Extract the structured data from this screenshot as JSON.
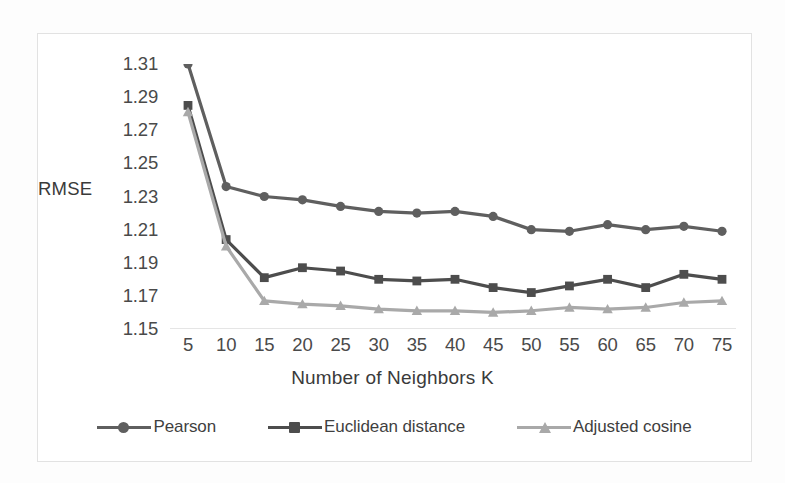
{
  "chart_data": {
    "type": "line",
    "title": "",
    "subtitle": "",
    "xlabel": "Number of Neighbors K",
    "ylabel": "RMSE",
    "x": [
      5,
      10,
      15,
      20,
      25,
      30,
      35,
      40,
      45,
      50,
      55,
      60,
      65,
      70,
      75
    ],
    "xticklabels": [
      "5",
      "10",
      "15",
      "20",
      "25",
      "30",
      "35",
      "40",
      "45",
      "50",
      "55",
      "60",
      "65",
      "70",
      "75"
    ],
    "yticklabels": [
      "1.31",
      "1.29",
      "1.27",
      "1.25",
      "1.23",
      "1.21",
      "1.19",
      "1.17",
      "1.15"
    ],
    "yticks": [
      1.31,
      1.29,
      1.27,
      1.25,
      1.23,
      1.21,
      1.19,
      1.17,
      1.15
    ],
    "ylim": [
      1.15,
      1.31
    ],
    "xlim": [
      5,
      75
    ],
    "grid": false,
    "legend_position": "bottom",
    "series": [
      {
        "name": "Pearson",
        "marker": "circle",
        "color": "#5f5f5f",
        "values": [
          1.31,
          1.236,
          1.23,
          1.228,
          1.224,
          1.221,
          1.22,
          1.221,
          1.218,
          1.21,
          1.209,
          1.213,
          1.21,
          1.212,
          1.209
        ]
      },
      {
        "name": "Euclidean distance",
        "marker": "square",
        "color": "#4d4d4d",
        "values": [
          1.285,
          1.204,
          1.181,
          1.187,
          1.185,
          1.18,
          1.179,
          1.18,
          1.175,
          1.172,
          1.176,
          1.18,
          1.175,
          1.183,
          1.18
        ]
      },
      {
        "name": "Adjusted cosine",
        "marker": "triangle",
        "color": "#a9a9a9",
        "values": [
          1.281,
          1.2,
          1.167,
          1.165,
          1.164,
          1.162,
          1.161,
          1.161,
          1.16,
          1.161,
          1.163,
          1.162,
          1.163,
          1.166,
          1.167
        ]
      }
    ]
  },
  "axis": {
    "y_title": "RMSE",
    "x_title": "Number of Neighbors K"
  },
  "legend": {
    "items": [
      {
        "label": "Pearson",
        "marker": "circle",
        "color": "#5f5f5f"
      },
      {
        "label": "Euclidean distance",
        "marker": "square",
        "color": "#4d4d4d"
      },
      {
        "label": "Adjusted cosine",
        "marker": "triangle",
        "color": "#a9a9a9"
      }
    ]
  },
  "colors": {
    "pearson": "#5f5f5f",
    "euclidean": "#4d4d4d",
    "adjusted_cosine": "#a9a9a9",
    "axis_text": "#4a4a4a",
    "frame": "#e2e2e2",
    "baseline": "#dcdcdc"
  }
}
